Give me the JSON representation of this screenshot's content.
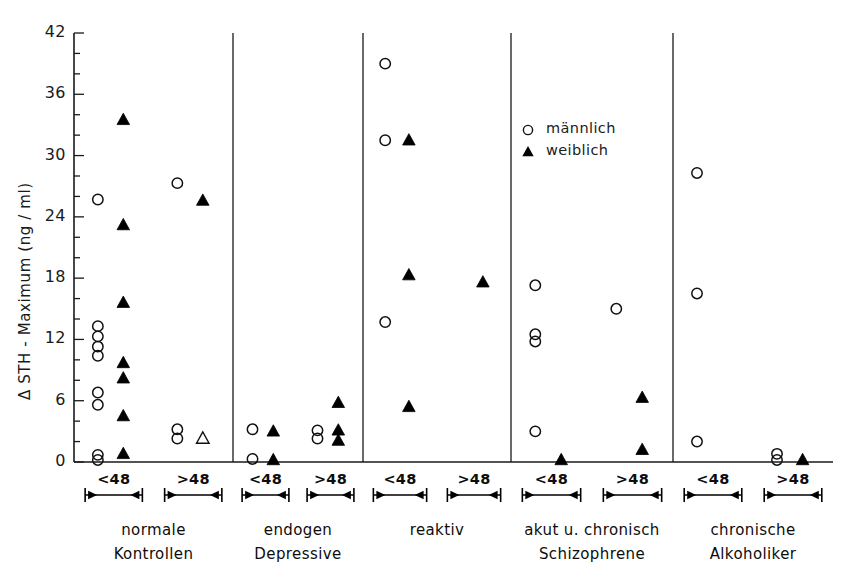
{
  "chart_data": {
    "type": "scatter",
    "title": "",
    "xlabel": "",
    "ylabel": "Δ STH - Maximum (ng / ml)",
    "ylim": [
      0,
      42
    ],
    "ytick_labels": [
      "0",
      "6",
      "12",
      "18",
      "24",
      "30",
      "36",
      "42"
    ],
    "ytick_values": [
      0,
      6,
      12,
      18,
      24,
      30,
      36,
      42
    ],
    "yminor_step": 2,
    "grid": false,
    "legend_position": "upper-right-inside",
    "legend": [
      {
        "marker": "open-circle",
        "label": "männlich"
      },
      {
        "marker": "filled-triangle",
        "label": "weiblich"
      }
    ],
    "range_labels": [
      "<48",
      ">48"
    ],
    "groups": [
      {
        "name_line1": "normale",
        "name_line2": "Kontrollen",
        "subgroups": [
          {
            "range": "<48",
            "maennlich": [
              25.7,
              13.3,
              12.3,
              11.3,
              10.4,
              6.8,
              5.6,
              0.7,
              0.2
            ],
            "weiblich": [
              33.5,
              23.2,
              15.6,
              9.7,
              8.2,
              4.5,
              0.8
            ]
          },
          {
            "range": ">48",
            "maennlich": [
              27.3,
              3.2,
              2.3
            ],
            "weiblich": [
              25.6
            ],
            "weiblich_open": [
              2.3
            ]
          }
        ]
      },
      {
        "name_line1": "endogen",
        "name_line2": "Depressive",
        "subgroups": [
          {
            "range": "<48",
            "maennlich": [
              3.2,
              0.3
            ],
            "weiblich": [
              3.0,
              0.2
            ]
          },
          {
            "range": ">48",
            "maennlich": [
              3.1,
              2.3
            ],
            "weiblich": [
              5.8,
              3.1,
              2.1
            ]
          }
        ]
      },
      {
        "name_line1": "reaktiv",
        "name_line2": "",
        "subgroups": [
          {
            "range": "<48",
            "maennlich": [
              39.0,
              31.5,
              13.7
            ],
            "weiblich": [
              31.5,
              18.3,
              5.4
            ]
          },
          {
            "range": ">48",
            "maennlich": [],
            "weiblich": [
              17.6
            ]
          }
        ]
      },
      {
        "name_line1": "akut u. chronisch",
        "name_line2": "Schizophrene",
        "subgroups": [
          {
            "range": "<48",
            "maennlich": [
              17.3,
              12.5,
              11.8,
              3.0
            ],
            "weiblich": [
              0.2
            ]
          },
          {
            "range": ">48",
            "maennlich": [
              15.0
            ],
            "weiblich": [
              6.3,
              1.2
            ]
          }
        ]
      },
      {
        "name_line1": "chronische",
        "name_line2": "Alkoholiker",
        "subgroups": [
          {
            "range": "<48",
            "maennlich": [
              28.3,
              16.5,
              2.0
            ],
            "weiblich": []
          },
          {
            "range": ">48",
            "maennlich": [
              0.8,
              0.2
            ],
            "weiblich": [
              0.2
            ]
          }
        ]
      }
    ]
  },
  "colors": {
    "ink": "#1a1a1a",
    "marker": "#000000",
    "background": "#ffffff"
  }
}
